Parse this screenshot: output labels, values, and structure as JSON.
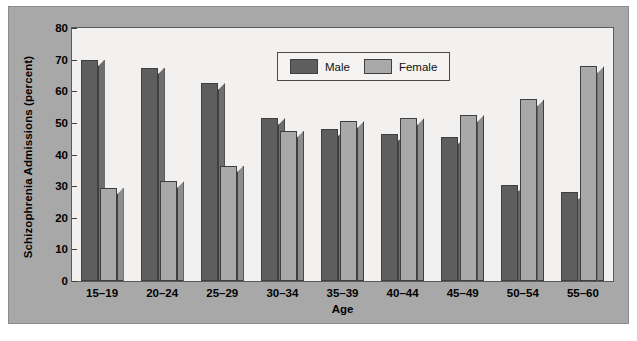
{
  "chart_data": {
    "type": "bar",
    "title": "",
    "xlabel": "Age",
    "ylabel": "Schizophrenia Admissions (percent)",
    "ylim": [
      0,
      80
    ],
    "yticks": [
      0,
      10,
      20,
      30,
      40,
      50,
      60,
      70,
      80
    ],
    "grid": false,
    "legend_position": "top-center",
    "categories": [
      "15–19",
      "20–24",
      "25–29",
      "30–34",
      "35–39",
      "40–44",
      "45–49",
      "50–54",
      "55–60"
    ],
    "series": [
      {
        "name": "Male",
        "color": "#5e5e5e",
        "values": [
          70,
          67.5,
          62.5,
          51.5,
          48,
          46.5,
          45.5,
          30.5,
          28
        ]
      },
      {
        "name": "Female",
        "color": "#a9a9a9",
        "values": [
          29.5,
          31.5,
          36.5,
          47.5,
          50.5,
          51.5,
          52.5,
          57.5,
          68
        ]
      }
    ]
  },
  "legend": {
    "items": [
      {
        "label": "Male",
        "swatch": "male"
      },
      {
        "label": "Female",
        "swatch": "female"
      }
    ]
  }
}
